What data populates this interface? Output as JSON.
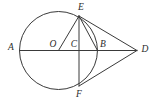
{
  "figure": {
    "name": "circle-with-external-point-tangents",
    "background_color": "#ffffff",
    "stroke_color": "#3a3a3a",
    "label_color": "#2b2b2b"
  },
  "labels": {
    "A": "A",
    "B": "B",
    "C": "C",
    "D": "D",
    "E": "E",
    "F": "F",
    "O": "O"
  },
  "geometry": {
    "circle": {
      "cx": 58.5,
      "cy": 50.5,
      "r": 39
    },
    "points": {
      "A": {
        "x": 19.5,
        "y": 50.5
      },
      "B": {
        "x": 97.5,
        "y": 50.5
      },
      "C": {
        "x": 79.0,
        "y": 50.5
      },
      "D": {
        "x": 137.0,
        "y": 50.5
      },
      "E": {
        "x": 79.0,
        "y": 16.0
      },
      "F": {
        "x": 79.0,
        "y": 86.0
      },
      "O": {
        "x": 58.5,
        "y": 50.5
      }
    },
    "segments": [
      {
        "name": "segment-AD",
        "from": "A",
        "to": "D"
      },
      {
        "name": "segment-EF",
        "from": "E",
        "to": "F"
      },
      {
        "name": "segment-OE",
        "from": "O",
        "to": "E"
      },
      {
        "name": "segment-ED",
        "from": "E",
        "to": "D"
      },
      {
        "name": "segment-FD",
        "from": "F",
        "to": "D"
      },
      {
        "name": "segment-EB",
        "from": "E",
        "to": "B"
      }
    ]
  },
  "label_positions": {
    "A": {
      "x": 11,
      "y": 48
    },
    "B": {
      "x": 103,
      "y": 45
    },
    "C": {
      "x": 74,
      "y": 45
    },
    "D": {
      "x": 145,
      "y": 50
    },
    "E": {
      "x": 81,
      "y": 8
    },
    "F": {
      "x": 79,
      "y": 95
    },
    "O": {
      "x": 53,
      "y": 45
    }
  }
}
